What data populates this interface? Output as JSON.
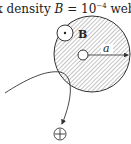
{
  "caption": {
    "prefix": "x density ",
    "symbol": "B",
    "equals": " = 10",
    "exponent": "−4",
    "unit": " weber"
  },
  "diagram": {
    "field_label": "B",
    "radius_label": "a",
    "field_symbol": "dot-in-circle (out of page)",
    "charge_symbol": "⊕",
    "colors": {
      "stroke": "#333333",
      "hatch": "#888888",
      "background": "#ffffff"
    }
  }
}
